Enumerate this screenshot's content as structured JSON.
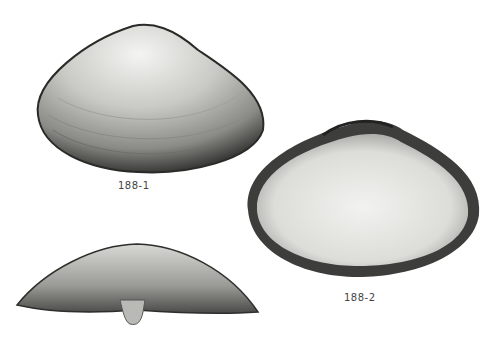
{
  "figure": {
    "background": "#ffffff",
    "shells": [
      {
        "id": "shell-exterior",
        "label": "188-1"
      },
      {
        "id": "shell-interior",
        "label": "188-2"
      },
      {
        "id": "shell-dorsal",
        "label": ""
      }
    ]
  }
}
